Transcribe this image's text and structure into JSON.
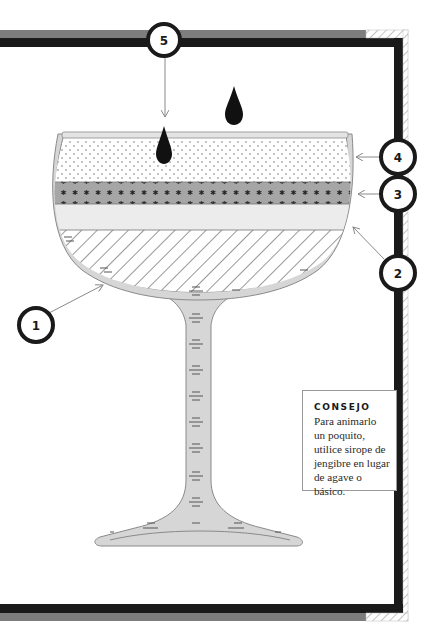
{
  "diagram": {
    "callouts": [
      {
        "number": "1",
        "target": "glass"
      },
      {
        "number": "2",
        "target": "layer-2-light"
      },
      {
        "number": "3",
        "target": "layer-3-stars"
      },
      {
        "number": "4",
        "target": "layer-4-dotted"
      },
      {
        "number": "5",
        "target": "drops"
      }
    ],
    "layers": [
      {
        "id": "1",
        "pattern": "diagonal-hatch"
      },
      {
        "id": "2",
        "pattern": "light-solid"
      },
      {
        "id": "3",
        "pattern": "stars"
      },
      {
        "id": "4",
        "pattern": "dots"
      }
    ],
    "drops_count": 2,
    "colors": {
      "frame_black": "#1a1a1a",
      "frame_gray": "#7d7d7d",
      "glass_fill": "#d6d6d6",
      "glass_stroke": "#8a8a8a",
      "layer_stars": "#a6a6a6",
      "layer_light": "#ececec",
      "drop": "#111111"
    }
  },
  "tip": {
    "title": "CONSEJO",
    "text": "Para animarlo un poquito, utilice sirope de jengibre en lugar de agave o básico."
  }
}
